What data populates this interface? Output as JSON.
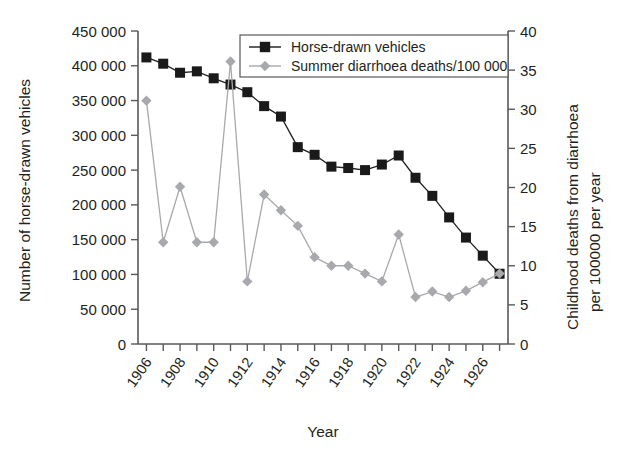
{
  "chart_data": {
    "type": "line",
    "title": "",
    "xlabel": "Year",
    "ylabel": "Number of horse-drawn vehicles",
    "y2label": "Childhood deaths from diarrhoea per 100000 per year",
    "grid": false,
    "legend_position": "top-center",
    "x": [
      1906,
      1907,
      1908,
      1909,
      1910,
      1911,
      1912,
      1913,
      1914,
      1915,
      1916,
      1917,
      1918,
      1919,
      1920,
      1921,
      1922,
      1923,
      1924,
      1925,
      1926,
      1927
    ],
    "xlim": [
      1905.5,
      1927.5
    ],
    "xtick_labels": [
      "1906",
      "1908",
      "1910",
      "1912",
      "1914",
      "1916",
      "1918",
      "1920",
      "1922",
      "1924",
      "1926"
    ],
    "xtick_values": [
      1906,
      1908,
      1910,
      1912,
      1914,
      1916,
      1918,
      1920,
      1922,
      1924,
      1926
    ],
    "ylim": [
      0,
      450000
    ],
    "ytick_labels": [
      "0",
      "50 000",
      "100 000",
      "150 000",
      "200 000",
      "250 000",
      "300 000",
      "350 000",
      "400 000",
      "450 000"
    ],
    "ytick_values": [
      0,
      50000,
      100000,
      150000,
      200000,
      250000,
      300000,
      350000,
      400000,
      450000
    ],
    "y2lim": [
      0,
      40
    ],
    "y2tick_labels": [
      "0",
      "5",
      "10",
      "15",
      "20",
      "25",
      "30",
      "35",
      "40"
    ],
    "y2tick_values": [
      0,
      5,
      10,
      15,
      20,
      25,
      30,
      35,
      40
    ],
    "series": [
      {
        "name": "Horse-drawn vehicles",
        "axis": "left",
        "color": "#1a1a1a",
        "marker": "square",
        "values": [
          412000,
          403000,
          390000,
          392000,
          382000,
          373000,
          362000,
          342000,
          327000,
          283000,
          272000,
          255000,
          253000,
          250000,
          258000,
          271000,
          239000,
          213000,
          182000,
          153000,
          127000,
          101000
        ]
      },
      {
        "name": "Summer diarrhoea deaths/100 000",
        "axis": "right",
        "color": "#a7a9ac",
        "marker": "diamond",
        "values": [
          31.1,
          13.0,
          20.1,
          13.0,
          13.0,
          36.1,
          8.0,
          19.1,
          17.1,
          15.1,
          11.1,
          10.0,
          10.0,
          9.0,
          8.0,
          14.0,
          6.0,
          6.7,
          6.0,
          6.8,
          7.9,
          9.0
        ]
      }
    ],
    "legend": [
      {
        "label": "Horse-drawn vehicles",
        "marker": "square",
        "color": "#1a1a1a"
      },
      {
        "label": "Summer diarrhoea deaths/100 000",
        "marker": "diamond",
        "color": "#a7a9ac"
      }
    ]
  },
  "axes": {
    "x_title": "Year",
    "y_left_title": "Number of horse-drawn vehicles",
    "y_right_title_line1": "Childhood deaths from diarrhoea",
    "y_right_title_line2": "per 100000 per year"
  }
}
